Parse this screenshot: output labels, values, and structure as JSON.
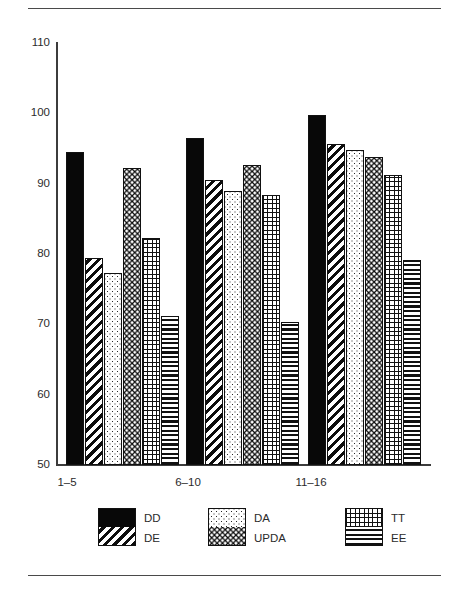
{
  "chart_data": {
    "type": "bar",
    "title": "",
    "subtitle": "",
    "xlabel": "",
    "ylabel": "",
    "ylim": [
      50,
      110
    ],
    "yticks": [
      110,
      100,
      90,
      80,
      70,
      60,
      50
    ],
    "grid": false,
    "legend_position": "bottom",
    "categories": [
      "1–5",
      "6–10",
      "11–16"
    ],
    "series": [
      {
        "name": "DD",
        "pattern": "solid-black",
        "values": [
          94.5,
          96.5,
          99.8
        ]
      },
      {
        "name": "DE",
        "pattern": "diagonal-hatch",
        "values": [
          79.5,
          90.5,
          95.7
        ]
      },
      {
        "name": "DA",
        "pattern": "fine-dots",
        "values": [
          77.3,
          89.0,
          94.8
        ]
      },
      {
        "name": "UPDA",
        "pattern": "white-dots-black",
        "values": [
          92.3,
          92.6,
          93.8
        ]
      },
      {
        "name": "TT",
        "pattern": "crosshatch-grid",
        "values": [
          82.3,
          88.4,
          91.3
        ]
      },
      {
        "name": "EE",
        "pattern": "horizontal-lines",
        "values": [
          71.2,
          70.3,
          79.2
        ]
      }
    ]
  },
  "axis": {
    "y_tick_110": "110",
    "y_tick_100": "100",
    "y_tick_90": "90",
    "y_tick_80": "80",
    "y_tick_70": "70",
    "y_tick_60": "60",
    "y_tick_50": "50"
  },
  "xlabels": {
    "g1": "1–5",
    "g2": "6–10",
    "g3": "11–16"
  },
  "legend": {
    "col1": {
      "top": "DD",
      "bottom": "DE"
    },
    "col2": {
      "top": "DA",
      "bottom": "UPDA"
    },
    "col3": {
      "top": "TT",
      "bottom": "EE"
    }
  },
  "colors": {
    "ink": "#111111",
    "axis": "#3c3c3c",
    "background": "#ffffff"
  }
}
